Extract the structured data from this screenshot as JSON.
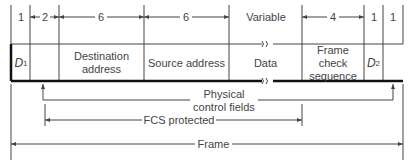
{
  "diagram": {
    "title": "Frame",
    "byte_counts": [
      "1",
      "2",
      "6",
      "6",
      "Variable",
      "4",
      "1",
      "1"
    ],
    "fields": [
      {
        "name": "D1",
        "label": "D",
        "sub": "1"
      },
      {
        "name": "blank",
        "label": ""
      },
      {
        "name": "destination",
        "label": "Destination address"
      },
      {
        "name": "source",
        "label": "Source address"
      },
      {
        "name": "data",
        "label": "Data"
      },
      {
        "name": "fcs",
        "label": "Frame check sequence"
      },
      {
        "name": "D2",
        "label": "D",
        "sub": "2"
      },
      {
        "name": "end",
        "label": ""
      }
    ],
    "spans": {
      "physical_control": "Physical control fields",
      "fcs_protected": "FCS protected",
      "frame": "Frame"
    }
  }
}
